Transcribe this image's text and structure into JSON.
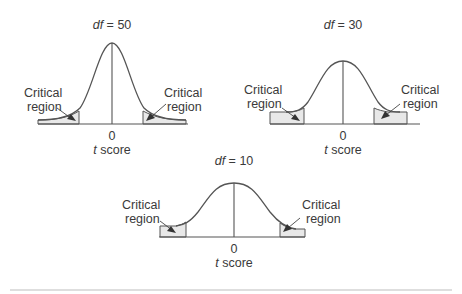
{
  "figure": {
    "panels": [
      {
        "title_var": "df",
        "title_eq": " = 50",
        "left_label_line1": "Critical",
        "left_label_line2": "region",
        "right_label_line1": "Critical",
        "right_label_line2": "region",
        "center_tick": "0",
        "axis_label_var": "t",
        "axis_label_rest": " score"
      },
      {
        "title_var": "df",
        "title_eq": " = 30",
        "left_label_line1": "Critical",
        "left_label_line2": "region",
        "right_label_line1": "Critical",
        "right_label_line2": "region",
        "center_tick": "0",
        "axis_label_var": "t",
        "axis_label_rest": " score"
      },
      {
        "title_var": "df",
        "title_eq": " = 10",
        "left_label_line1": "Critical",
        "left_label_line2": "region",
        "right_label_line1": "Critical",
        "right_label_line2": "region",
        "center_tick": "0",
        "axis_label_var": "t",
        "axis_label_rest": " score"
      }
    ],
    "colors": {
      "curve": "#555555",
      "shading": "#e8e8e8",
      "text": "#3a3a3a",
      "divider": "#bdbdbd"
    }
  }
}
